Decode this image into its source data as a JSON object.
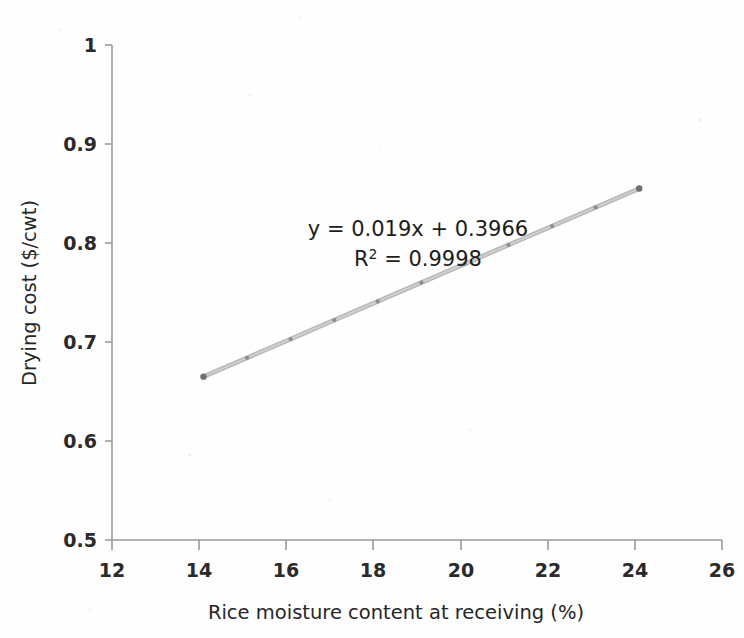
{
  "figure": {
    "background_color": "#fefefe",
    "annotation": {
      "equation": "y = 0.019x + 0.3966",
      "r_squared_prefix": "R",
      "r_squared_sup": "2",
      "r_squared_value": " = 0.9998"
    }
  },
  "chart_data": {
    "type": "scatter",
    "title": "",
    "xlabel": "Rice moisture content at receiving (%)",
    "ylabel": "Drying cost ($/cwt)",
    "xlim": [
      12,
      26
    ],
    "ylim": [
      0.5,
      1
    ],
    "xticks": [
      12,
      14,
      16,
      18,
      20,
      22,
      24,
      26
    ],
    "yticks": [
      0.5,
      0.6,
      0.7,
      0.8,
      0.9,
      1
    ],
    "xtick_labels": [
      "12",
      "14",
      "16",
      "18",
      "20",
      "22",
      "24",
      "26"
    ],
    "ytick_labels": [
      "0.5",
      "0.6",
      "0.7",
      "0.8",
      "0.9",
      "1"
    ],
    "grid": false,
    "legend": false,
    "series": [
      {
        "name": "Drying cost",
        "marker": "dot",
        "line_color": "#b6b6b6",
        "marker_color": "#8e8e8e",
        "x": [
          14.1,
          15.1,
          16.1,
          17.1,
          18.1,
          19.1,
          20.1,
          21.1,
          22.1,
          23.1,
          24.1
        ],
        "y": [
          0.665,
          0.684,
          0.703,
          0.722,
          0.741,
          0.76,
          0.779,
          0.798,
          0.817,
          0.836,
          0.855
        ]
      }
    ],
    "trendline": {
      "slope": 0.019,
      "intercept": 0.3966,
      "r_squared": 0.9998,
      "equation_label": "y = 0.019x + 0.3966",
      "r_squared_label": "R² = 0.9998"
    }
  },
  "annotations": {
    "equation_line1": "y = 0.019x + 0.3966",
    "equation_line2_prefix": "R",
    "equation_line2_sup": "2",
    "equation_line2_rest": " = 0.9998"
  }
}
